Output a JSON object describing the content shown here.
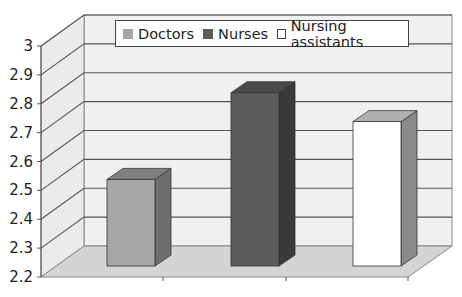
{
  "chart_data": {
    "type": "bar",
    "style": "3d-column",
    "title": "",
    "xlabel": "",
    "ylabel": "",
    "categories": [
      ""
    ],
    "series": [
      {
        "name": "Doctors",
        "values": [
          2.5
        ],
        "color": "#a6a6a6",
        "side_color": "#6e6e6e",
        "top_color": "#808080"
      },
      {
        "name": "Nurses",
        "values": [
          2.8
        ],
        "color": "#5c5c5c",
        "side_color": "#3a3a3a",
        "top_color": "#4a4a4a"
      },
      {
        "name": "Nursing assistants",
        "values": [
          2.7
        ],
        "color": "#ffffff",
        "side_color": "#8a8a8a",
        "top_color": "#b0b0b0"
      }
    ],
    "ylim": [
      2.2,
      3
    ],
    "yticks": [
      "2.2",
      "2.3",
      "2.4",
      "2.5",
      "2.6",
      "2.7",
      "2.8",
      "2.9",
      "3"
    ],
    "grid": true,
    "legend": {
      "position": "top",
      "entries": [
        "Doctors",
        "Nurses",
        "Nursing assistants"
      ]
    }
  }
}
